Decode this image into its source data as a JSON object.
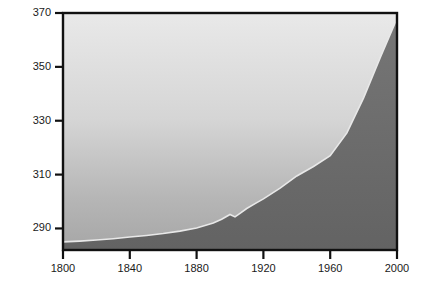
{
  "chart_data": {
    "type": "area",
    "title": "",
    "xlabel": "Year",
    "ylabel": "ppm",
    "xlim": [
      1800,
      2000
    ],
    "ylim": [
      282,
      370
    ],
    "grid": false,
    "legend": null,
    "xticks": [
      1800,
      1840,
      1880,
      1920,
      1960,
      2000
    ],
    "yticks": [
      290,
      310,
      330,
      350,
      370
    ],
    "series": [
      {
        "name": "Atmospheric CO2 concentration",
        "x": [
          1800,
          1810,
          1820,
          1830,
          1840,
          1850,
          1860,
          1870,
          1880,
          1890,
          1895,
          1900,
          1903,
          1906,
          1910,
          1915,
          1920,
          1930,
          1940,
          1950,
          1960,
          1970,
          1980,
          1990,
          2000
        ],
        "values": [
          285.0,
          285.3,
          285.7,
          286.2,
          286.8,
          287.4,
          288.1,
          289.0,
          290.2,
          292.0,
          293.4,
          295.2,
          294.3,
          295.6,
          297.4,
          299.2,
          301.0,
          305.0,
          309.5,
          313.0,
          317.0,
          325.5,
          338.5,
          353.5,
          368.0
        ]
      }
    ],
    "fill_above_color": "#d9d9d9",
    "fill_below_color": "#6f6f6f",
    "curve_color": "#e6e6e6",
    "axis_color": "#111111"
  },
  "axes": {
    "y_label_text": "ppm",
    "x_label_text": "Year",
    "ytick_labels": [
      "290",
      "310",
      "330",
      "350",
      "370"
    ],
    "xtick_labels": [
      "1800",
      "1840",
      "1880",
      "1920",
      "1960",
      "2000"
    ]
  }
}
